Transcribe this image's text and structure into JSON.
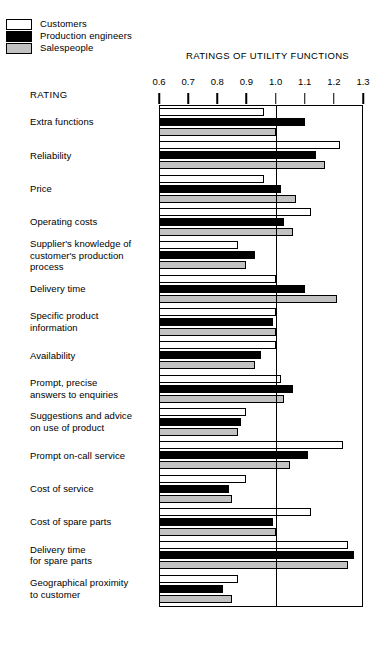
{
  "chart_title": "RATINGS OF UTILITY FUNCTIONS",
  "rating_caption": "RATING",
  "legend": {
    "items": [
      {
        "label": "Customers",
        "swatch": "white",
        "color": "#ffffff"
      },
      {
        "label": "Production engineers",
        "swatch": "black",
        "color": "#000000"
      },
      {
        "label": "Salespeople",
        "swatch": "gray",
        "color": "#c2c2c2"
      }
    ]
  },
  "chart_data": {
    "type": "bar",
    "orientation": "horizontal",
    "title": "RATINGS OF UTILITY FUNCTIONS",
    "xlabel": "RATING",
    "ylabel": "",
    "xlim": [
      0.6,
      1.3
    ],
    "xticks": [
      0.6,
      0.7,
      0.8,
      0.9,
      1.0,
      1.1,
      1.2,
      1.3
    ],
    "xtick_labels": [
      "0.6",
      "0.7",
      "0.8",
      "0.9",
      "1.0",
      "1.1",
      "1.2",
      "1.3"
    ],
    "reference_line": 1.0,
    "grid": false,
    "legend_position": "top-left",
    "categories": [
      "Extra functions",
      "Reliability",
      "Price",
      "Operating costs",
      "Supplier's knowledge of customer's production process",
      "Delivery time",
      "Specific product information",
      "Availability",
      "Prompt, precise answers to enquiries",
      "Suggestions and advice on use of product",
      "Prompt on-call service",
      "Cost of service",
      "Cost of spare parts",
      "Delivery time for spare parts",
      "Geographical proximity to customer"
    ],
    "category_lines": [
      [
        "Extra functions"
      ],
      [
        "Reliability"
      ],
      [
        "Price"
      ],
      [
        "Operating costs"
      ],
      [
        "Supplier's knowledge of",
        "customer's production",
        "process"
      ],
      [
        "Delivery time"
      ],
      [
        "Specific product",
        "information"
      ],
      [
        "Availability"
      ],
      [
        "Prompt, precise",
        "answers to enquiries"
      ],
      [
        "Suggestions and advice",
        "on use of product"
      ],
      [
        "Prompt on-call service"
      ],
      [
        "Cost of service"
      ],
      [
        "Cost of spare parts"
      ],
      [
        "Delivery time",
        "for spare parts"
      ],
      [
        "Geographical proximity",
        "to customer"
      ]
    ],
    "series": [
      {
        "name": "Customers",
        "color": "#ffffff",
        "values": [
          0.96,
          1.22,
          0.96,
          1.12,
          0.87,
          1.0,
          1.0,
          1.0,
          1.02,
          0.9,
          1.23,
          0.9,
          1.12,
          1.25,
          0.87
        ]
      },
      {
        "name": "Production engineers",
        "color": "#000000",
        "values": [
          1.1,
          1.14,
          1.02,
          1.03,
          0.93,
          1.1,
          0.99,
          0.95,
          1.06,
          0.88,
          1.11,
          0.84,
          0.99,
          1.27,
          0.82
        ]
      },
      {
        "name": "Salespeople",
        "color": "#c2c2c2",
        "values": [
          1.0,
          1.17,
          1.07,
          1.06,
          0.9,
          1.21,
          1.0,
          0.93,
          1.03,
          0.87,
          1.05,
          0.85,
          1.0,
          1.25,
          0.85
        ]
      }
    ]
  }
}
